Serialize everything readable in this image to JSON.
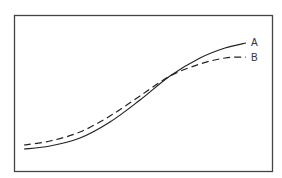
{
  "chart_data": {
    "type": "line",
    "title": "",
    "xlabel": "",
    "ylabel": "",
    "grid": false,
    "legend_position": "inline-right",
    "series": [
      {
        "name": "A",
        "style": "solid",
        "points": [
          [
            24,
            149
          ],
          [
            50,
            146
          ],
          [
            80,
            138
          ],
          [
            110,
            122
          ],
          [
            140,
            100
          ],
          [
            170,
            76
          ],
          [
            200,
            58
          ],
          [
            225,
            48
          ],
          [
            246,
            43
          ]
        ]
      },
      {
        "name": "B",
        "style": "dashed",
        "points": [
          [
            24,
            145
          ],
          [
            50,
            141
          ],
          [
            80,
            132
          ],
          [
            110,
            116
          ],
          [
            140,
            96
          ],
          [
            170,
            76
          ],
          [
            200,
            64
          ],
          [
            225,
            58
          ],
          [
            246,
            57
          ]
        ]
      }
    ]
  },
  "labels": {
    "a": "A",
    "b": "B"
  },
  "colors": {
    "frame": "#444444",
    "line": "#222222"
  }
}
